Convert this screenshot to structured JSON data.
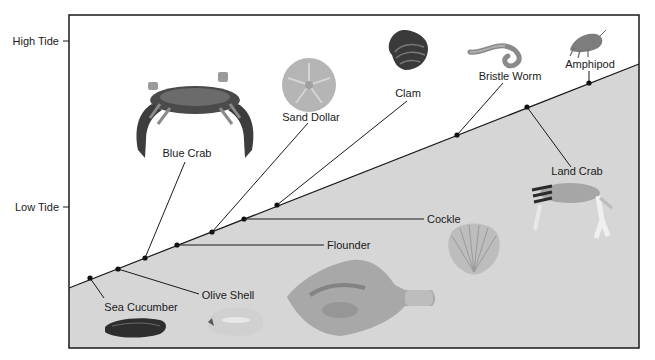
{
  "diagram": {
    "axis": {
      "high_tide_label": "High Tide",
      "low_tide_label": "Low Tide"
    },
    "colors": {
      "sky": "#ffffff",
      "sand": "#d6d6d6",
      "line": "#1a1a1a"
    },
    "organisms": [
      {
        "id": "sea-cucumber",
        "label": "Sea Cucumber",
        "order_from_low": 1
      },
      {
        "id": "olive-shell",
        "label": "Olive Shell",
        "order_from_low": 2
      },
      {
        "id": "blue-crab",
        "label": "Blue Crab",
        "order_from_low": 3
      },
      {
        "id": "flounder",
        "label": "Flounder",
        "order_from_low": 4
      },
      {
        "id": "sand-dollar",
        "label": "Sand Dollar",
        "order_from_low": 5
      },
      {
        "id": "cockle",
        "label": "Cockle",
        "order_from_low": 6
      },
      {
        "id": "clam",
        "label": "Clam",
        "order_from_low": 7
      },
      {
        "id": "bristle-worm",
        "label": "Bristle Worm",
        "order_from_low": 8
      },
      {
        "id": "land-crab",
        "label": "Land Crab",
        "order_from_low": 9
      },
      {
        "id": "amphipod",
        "label": "Amphipod",
        "order_from_low": 10
      }
    ]
  }
}
